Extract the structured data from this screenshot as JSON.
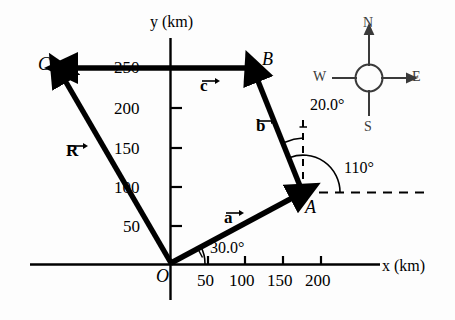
{
  "figure": {
    "type": "vector-diagram",
    "axes": {
      "x_label": "x (km)",
      "y_label": "y (km)",
      "x_ticks": [
        "50",
        "100",
        "150",
        "200"
      ],
      "y_ticks": [
        "50",
        "100",
        "150",
        "200",
        "250"
      ],
      "x_tick_values": [
        50,
        100,
        150,
        200
      ],
      "y_tick_values": [
        50,
        100,
        150,
        200,
        250
      ],
      "units": "km"
    },
    "points": [
      {
        "name": "O",
        "label": "O",
        "x_km": 0,
        "y_km": 0
      },
      {
        "name": "A",
        "label": "A",
        "x_km": 175,
        "y_km": 95
      },
      {
        "name": "B",
        "label": "B",
        "x_km": 110,
        "y_km": 260
      },
      {
        "name": "C",
        "label": "C",
        "x_km": -145,
        "y_km": 260
      }
    ],
    "vectors": [
      {
        "name": "a",
        "label": "a",
        "from": "O",
        "to": "A"
      },
      {
        "name": "b",
        "label": "b",
        "from": "A",
        "to": "B"
      },
      {
        "name": "c",
        "label": "c",
        "from": "B",
        "to": "C"
      },
      {
        "name": "R",
        "label": "R",
        "from": "O",
        "to": "C"
      }
    ],
    "angles": [
      {
        "name": "angle-a-from-x-axis",
        "label": "30.0°",
        "value": 30.0
      },
      {
        "name": "angle-b-from-vertical",
        "label": "20.0°",
        "value": 20.0
      },
      {
        "name": "angle-b-from-x-axis",
        "label": "110°",
        "value": 110
      }
    ],
    "compass": {
      "north": "N",
      "south": "S",
      "east": "E",
      "west": "W"
    },
    "colors": {
      "ink": "#000000",
      "background": "#ffffff",
      "compass": "#3a3a3a"
    }
  }
}
